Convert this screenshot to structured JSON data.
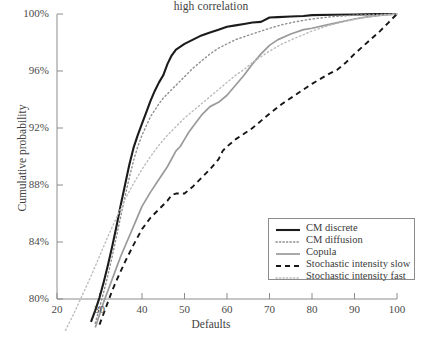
{
  "chart_data": {
    "type": "line",
    "title": "high correlation",
    "xlabel": "Defaults",
    "ylabel": "Cumulative probability",
    "xlim": [
      20,
      100
    ],
    "ylim": [
      80,
      100
    ],
    "xticks": [
      20,
      30,
      40,
      50,
      60,
      70,
      80,
      90,
      100
    ],
    "xtick_labels": [
      "20",
      "30",
      "40",
      "50",
      "60",
      "70",
      "80",
      "90",
      "100"
    ],
    "yticks": [
      80,
      84,
      88,
      92,
      96,
      100
    ],
    "ytick_labels": [
      "80%",
      "84%",
      "88%",
      "92%",
      "96%",
      "100%"
    ],
    "grid": false,
    "legend_position": "lower right",
    "series": [
      {
        "name": "CM discrete",
        "style": "solid",
        "color": "#1b1b1b",
        "width": 2.1,
        "x": [
          28.0,
          29.0,
          30.0,
          31.0,
          32.0,
          33.0,
          34.0,
          35.0,
          36.0,
          37.0,
          38.0,
          39.0,
          40.0,
          41.0,
          42.0,
          43.0,
          44.0,
          45.0,
          46.0,
          47.0,
          48.0,
          50.0,
          52.0,
          54.0,
          56.0,
          58.0,
          60.0,
          62.0,
          64.0,
          66.0,
          68.0,
          70.0,
          72.0,
          75.0,
          78.0,
          80.0,
          85.0,
          90.0,
          95.0,
          100.0
        ],
        "y": [
          78.4,
          79.2,
          80.1,
          81.2,
          82.4,
          83.7,
          85.1,
          86.6,
          88.0,
          89.4,
          90.6,
          91.5,
          92.3,
          93.1,
          93.9,
          94.6,
          95.2,
          95.7,
          96.5,
          97.1,
          97.5,
          97.9,
          98.2,
          98.5,
          98.7,
          98.9,
          99.1,
          99.2,
          99.3,
          99.4,
          99.45,
          99.75,
          99.78,
          99.82,
          99.86,
          99.92,
          99.95,
          99.97,
          99.99,
          100.0
        ]
      },
      {
        "name": "CM diffusion",
        "style": "dotted",
        "color": "#8e8e8e",
        "width": 1.4,
        "x": [
          29.0,
          30.0,
          31.0,
          32.0,
          33.0,
          34.0,
          35.0,
          36.0,
          37.0,
          38.0,
          39.0,
          40.0,
          42.0,
          44.0,
          45.0,
          46.0,
          47.0,
          48.0,
          50.0,
          52.0,
          54.0,
          56.0,
          58.0,
          60.0,
          62.0,
          64.0,
          66.0,
          68.0,
          70.0,
          73.0,
          76.0,
          80.0,
          85.0,
          90.0,
          95.0,
          100.0
        ],
        "y": [
          78.3,
          79.4,
          80.5,
          81.7,
          83.0,
          84.4,
          85.8,
          87.2,
          88.5,
          89.7,
          90.7,
          91.5,
          92.8,
          93.7,
          94.1,
          94.4,
          94.7,
          95.0,
          95.6,
          96.2,
          96.7,
          97.2,
          97.6,
          97.9,
          98.2,
          98.4,
          98.6,
          98.8,
          99.0,
          99.25,
          99.45,
          99.65,
          99.82,
          99.92,
          99.97,
          100.0
        ]
      },
      {
        "name": "Copula",
        "style": "solid",
        "color": "#9a9a9a",
        "width": 1.7,
        "x": [
          29.0,
          30.0,
          31.0,
          32.0,
          33.0,
          34.0,
          35.0,
          36.0,
          38.0,
          40.0,
          42.0,
          44.0,
          46.0,
          48.0,
          49.0,
          50.0,
          51.0,
          52.0,
          54.0,
          56.0,
          58.0,
          60.0,
          62.0,
          64.0,
          66.0,
          68.0,
          70.0,
          72.0,
          75.0,
          78.0,
          80.0,
          83.0,
          86.0,
          90.0,
          93.0,
          96.0,
          100.0
        ],
        "y": [
          78.0,
          78.9,
          79.8,
          80.6,
          81.4,
          82.2,
          83.0,
          83.7,
          85.1,
          86.5,
          87.5,
          88.4,
          89.3,
          90.4,
          90.7,
          91.2,
          91.7,
          92.1,
          92.9,
          93.5,
          93.8,
          94.3,
          95.0,
          95.7,
          96.5,
          97.2,
          97.8,
          98.2,
          98.6,
          98.9,
          99.0,
          99.2,
          99.4,
          99.65,
          99.8,
          99.9,
          100.0
        ]
      },
      {
        "name": "Stochastic intensity slow",
        "style": "dashed",
        "color": "#161616",
        "width": 1.9,
        "x": [
          30.0,
          31.0,
          32.0,
          33.0,
          34.0,
          36.0,
          38.0,
          40.0,
          42.0,
          44.0,
          46.0,
          47.0,
          48.0,
          49.0,
          50.0,
          52.0,
          54.0,
          56.0,
          58.0,
          59.0,
          60.0,
          62.0,
          64.0,
          66.0,
          68.0,
          70.0,
          73.0,
          76.0,
          80.0,
          84.0,
          86.0,
          88.0,
          90.0,
          93.0,
          96.0,
          98.0,
          100.0
        ],
        "y": [
          78.2,
          79.0,
          79.8,
          80.6,
          81.3,
          82.6,
          83.8,
          84.9,
          85.7,
          86.3,
          86.9,
          87.3,
          87.4,
          87.4,
          87.4,
          87.9,
          88.5,
          89.1,
          89.8,
          90.4,
          90.7,
          91.2,
          91.6,
          92.0,
          92.5,
          93.0,
          93.7,
          94.3,
          95.1,
          95.8,
          96.1,
          96.6,
          97.2,
          98.0,
          98.8,
          99.4,
          100.0
        ]
      },
      {
        "name": "Stochastic intensity fast",
        "style": "dotted",
        "color": "#bcbcbc",
        "width": 1.4,
        "x": [
          22.0,
          24.0,
          26.0,
          28.0,
          30.0,
          32.0,
          34.0,
          36.0,
          38.0,
          40.0,
          42.0,
          44.0,
          46.0,
          48.0,
          50.0,
          52.0,
          54.0,
          56.0,
          58.0,
          60.0,
          62.0,
          64.0,
          66.0,
          68.0,
          70.0,
          73.0,
          76.0,
          80.0,
          84.0,
          88.0,
          92.0,
          96.0,
          100.0
        ],
        "y": [
          77.8,
          79.0,
          80.3,
          81.6,
          83.0,
          84.4,
          85.7,
          87.0,
          88.1,
          89.1,
          90.0,
          90.8,
          91.5,
          92.1,
          92.7,
          93.2,
          93.7,
          94.2,
          94.7,
          95.2,
          95.7,
          96.1,
          96.6,
          97.0,
          97.4,
          97.9,
          98.3,
          98.8,
          99.2,
          99.5,
          99.75,
          99.9,
          100.0
        ]
      }
    ]
  },
  "legend": {
    "items": [
      {
        "label": "CM discrete"
      },
      {
        "label": "CM diffusion"
      },
      {
        "label": "Copula"
      },
      {
        "label": "Stochastic intensity slow"
      },
      {
        "label": "Stochastic intensity fast"
      }
    ]
  },
  "axis": {
    "line_color": "#8c8c8c"
  }
}
